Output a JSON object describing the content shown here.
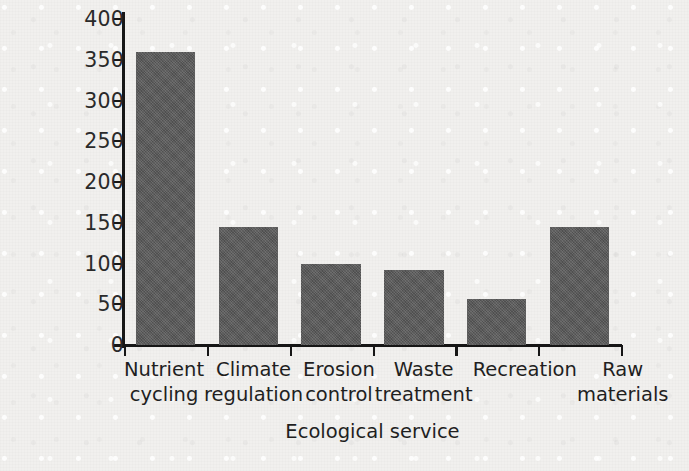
{
  "chart_data": {
    "type": "bar",
    "title": "",
    "xlabel": "Ecological service",
    "ylabel": "Worth (billions of dollars)",
    "categories": [
      "Nutrient cycling",
      "Climate regulation",
      "Erosion control",
      "Waste treatment",
      "Recreation",
      "Raw materials"
    ],
    "category_lines": [
      [
        "Nutrient",
        "cycling"
      ],
      [
        "Climate",
        "regulation"
      ],
      [
        "Erosion",
        "control"
      ],
      [
        "Waste",
        "treatment"
      ],
      [
        "Recreation",
        ""
      ],
      [
        "Raw",
        "materials"
      ]
    ],
    "values": [
      360,
      145,
      100,
      92,
      57,
      145
    ],
    "ylim": [
      0,
      400
    ],
    "ytick_values": [
      0,
      50,
      100,
      150,
      200,
      250,
      300,
      350,
      400
    ],
    "ytick_labels": [
      "0",
      "50",
      "100",
      "150",
      "200",
      "250",
      "300",
      "350",
      "400"
    ],
    "grid": false,
    "legend": "none",
    "bar_color": "#5a5a5a",
    "axis_color": "#161616",
    "background_color": "#f1f0ee"
  }
}
